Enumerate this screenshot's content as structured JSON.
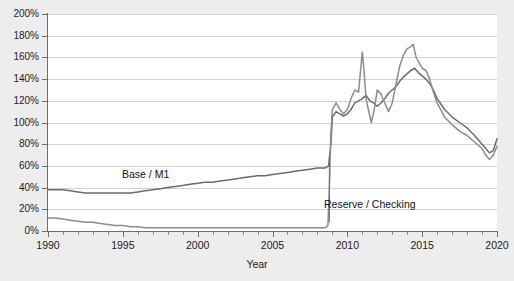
{
  "chart_title": "",
  "axes": {
    "y": {
      "label": "",
      "ticks": [
        "0%",
        "20%",
        "40%",
        "60%",
        "80%",
        "100%",
        "120%",
        "140%",
        "160%",
        "180%",
        "200%"
      ],
      "min": 0,
      "max": 200,
      "step": 20,
      "unit": "%"
    },
    "x": {
      "label": "Year",
      "ticks": [
        "1990",
        "1995",
        "2000",
        "2005",
        "2010",
        "2015",
        "2020"
      ],
      "min": 1990,
      "max": 2020,
      "step": 5
    }
  },
  "annotations": {
    "base_label": "Base / M1",
    "reserve_label": "Reserve / Checking"
  },
  "colors": {
    "series_base": "#6b6b6b",
    "series_reserve": "#8c8c8c",
    "gridline": "#d2d2d2",
    "axis": "#6d6d6d",
    "plot_background": "#ffffff",
    "page_background": "#ededed",
    "text": "#1c1c1c"
  },
  "chart_data": {
    "type": "line",
    "title": "",
    "xlabel": "Year",
    "ylabel": "",
    "xlim": [
      1990,
      2020
    ],
    "ylim": [
      0,
      200
    ],
    "grid": true,
    "legend": "inline-annotations",
    "series": [
      {
        "name": "Base / M1",
        "label_text": "Base / M1",
        "color": "#6b6b6b",
        "x": [
          1990,
          1990.5,
          1991,
          1991.5,
          1992,
          1992.5,
          1993,
          1993.5,
          1994,
          1994.5,
          1995,
          1995.5,
          1996,
          1996.5,
          1997,
          1997.5,
          1998,
          1998.5,
          1999,
          1999.5,
          2000,
          2000.5,
          2001,
          2001.5,
          2002,
          2002.5,
          2003,
          2003.5,
          2004,
          2004.5,
          2005,
          2005.5,
          2006,
          2006.5,
          2007,
          2007.5,
          2008,
          2008.25,
          2008.5,
          2008.75,
          2008.9,
          2009,
          2009.25,
          2009.5,
          2009.75,
          2010,
          2010.25,
          2010.5,
          2010.75,
          2011,
          2011.25,
          2011.5,
          2011.75,
          2012,
          2012.25,
          2012.5,
          2012.75,
          2013,
          2013.25,
          2013.5,
          2013.75,
          2014,
          2014.25,
          2014.5,
          2014.75,
          2015,
          2015.25,
          2015.5,
          2015.75,
          2016,
          2016.5,
          2017,
          2017.5,
          2018,
          2018.5,
          2019,
          2019.25,
          2019.5,
          2019.75,
          2020
        ],
        "y": [
          38,
          38,
          38,
          37,
          36,
          35,
          35,
          35,
          35,
          35,
          35,
          35,
          36,
          37,
          38,
          39,
          40,
          41,
          42,
          43,
          44,
          45,
          45,
          46,
          47,
          48,
          49,
          50,
          51,
          51,
          52,
          53,
          54,
          55,
          56,
          57,
          58,
          58,
          58,
          60,
          80,
          105,
          110,
          108,
          106,
          108,
          112,
          118,
          120,
          122,
          125,
          120,
          118,
          115,
          118,
          122,
          127,
          130,
          133,
          138,
          142,
          145,
          148,
          150,
          146,
          143,
          140,
          136,
          130,
          122,
          112,
          105,
          100,
          95,
          88,
          80,
          76,
          72,
          74,
          85
        ]
      },
      {
        "name": "Reserve / Checking",
        "label_text": "Reserve / Checking",
        "color": "#8c8c8c",
        "x": [
          1990,
          1990.5,
          1991,
          1991.5,
          1992,
          1992.5,
          1993,
          1993.5,
          1994,
          1994.5,
          1995,
          1995.5,
          1996,
          1996.5,
          1997,
          1997.5,
          1998,
          1999,
          2000,
          2001,
          2002,
          2003,
          2004,
          2005,
          2006,
          2007,
          2008,
          2008.5,
          2008.7,
          2008.8,
          2008.9,
          2009,
          2009.25,
          2009.5,
          2009.75,
          2010,
          2010.25,
          2010.5,
          2010.75,
          2011,
          2011.1,
          2011.25,
          2011.4,
          2011.6,
          2011.8,
          2012,
          2012.25,
          2012.5,
          2012.75,
          2013,
          2013.25,
          2013.5,
          2013.75,
          2014,
          2014.25,
          2014.4,
          2014.6,
          2014.8,
          2015,
          2015.25,
          2015.5,
          2015.75,
          2016,
          2016.5,
          2017,
          2017.5,
          2018,
          2018.5,
          2019,
          2019.25,
          2019.5,
          2019.75,
          2020
        ],
        "y": [
          12,
          12,
          11,
          10,
          9,
          8,
          8,
          7,
          6,
          5,
          5,
          4,
          4,
          3,
          3,
          3,
          3,
          3,
          3,
          3,
          3,
          3,
          3,
          3,
          3,
          3,
          3,
          3,
          5,
          40,
          90,
          112,
          118,
          112,
          108,
          112,
          122,
          130,
          128,
          165,
          150,
          122,
          112,
          100,
          112,
          130,
          126,
          118,
          110,
          118,
          135,
          152,
          162,
          168,
          170,
          172,
          160,
          155,
          150,
          148,
          140,
          128,
          118,
          105,
          98,
          92,
          88,
          82,
          76,
          70,
          66,
          70,
          78
        ]
      }
    ]
  }
}
